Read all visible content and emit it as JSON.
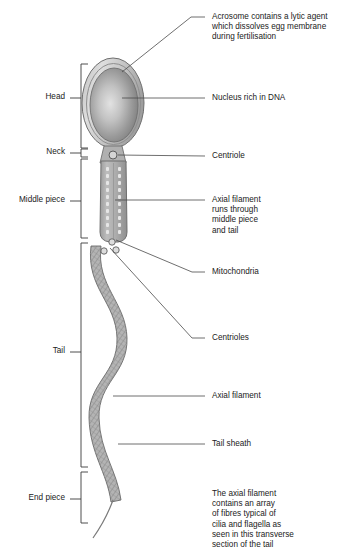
{
  "figure": {
    "background": "#ffffff",
    "ink": "#222222",
    "cell_fill": "#a8a8a8",
    "cell_outline": "#6d6d6d",
    "acrosome_fill": "#c9c9c9"
  },
  "region_labels": [
    {
      "id": "head",
      "text": "Head",
      "x": 66,
      "y": 98,
      "bracket_top": 64,
      "bracket_bottom": 148
    },
    {
      "id": "neck",
      "text": "Neck",
      "x": 66,
      "y": 152,
      "bracket_top": 149,
      "bracket_bottom": 157
    },
    {
      "id": "middle-piece",
      "text": "Middle piece",
      "x": 66,
      "y": 201,
      "bracket_top": 158,
      "bracket_bottom": 238
    },
    {
      "id": "tail",
      "text": "Tail",
      "x": 66,
      "y": 348,
      "bracket_top": 243,
      "bracket_bottom": 467
    },
    {
      "id": "end-piece",
      "text": "End piece",
      "x": 66,
      "y": 496,
      "bracket_top": 472,
      "bracket_bottom": 523
    }
  ],
  "callouts": [
    {
      "id": "acrosome",
      "text": "Acrosome contains a lytic agent\nwhich dissolves egg membrane\nduring fertilisation",
      "x": 212,
      "y": 12,
      "leader": "M 205 17 L 190 17 L 120 73"
    },
    {
      "id": "nucleus",
      "text": "Nucleus rich in DNA",
      "x": 212,
      "y": 94,
      "leader": "M 205 98 L 121 98"
    },
    {
      "id": "centriole",
      "text": "Centriole",
      "x": 212,
      "y": 152,
      "leader": "M 205 156 L 117 154"
    },
    {
      "id": "axial-filament-middle",
      "text": "Axial filament\nruns through\nmiddle piece\nand tail",
      "x": 212,
      "y": 196,
      "leader": "M 205 200 L 118 200"
    },
    {
      "id": "mitochondria",
      "text": "Mitochondria",
      "x": 212,
      "y": 268,
      "leader": "M 205 272 L 190 272 L 114 238"
    },
    {
      "id": "centrioles",
      "text": "Centrioles",
      "x": 212,
      "y": 334,
      "leader": "M 205 338 L 190 338 L 110 247"
    },
    {
      "id": "axial-filament-tail",
      "text": "Axial filament",
      "x": 212,
      "y": 392,
      "leader": "M 205 396 L 115 396"
    },
    {
      "id": "tail-sheath",
      "text": "Tail sheath",
      "x": 212,
      "y": 440,
      "leader": "M 205 444 L 117 444"
    },
    {
      "id": "transverse-section-note",
      "text": "The axial filament\ncontains an array\nof fibres typical of\ncilia and flagella as\nseen in this transverse\nsection of the tail",
      "x": 212,
      "y": 492,
      "leader": ""
    }
  ],
  "structures": {
    "head": {
      "cx": 113,
      "cy": 103,
      "rx": 31,
      "ry": 45
    },
    "neck": {
      "cx": 113,
      "cy": 155,
      "r": 4
    },
    "middle_piece": {
      "x_left": 100,
      "x_right": 127,
      "y_top": 160,
      "y_bottom": 240
    },
    "mitochondria_dots_per_column": 11,
    "centriole_circles": [
      {
        "cx": 112,
        "cy": 242,
        "r": 3
      },
      {
        "cx": 105,
        "cy": 250,
        "r": 3
      },
      {
        "cx": 117,
        "cy": 249,
        "r": 3
      }
    ],
    "tail_sheath_end_y": 500,
    "end_filament_tip": {
      "x": 93,
      "y": 538
    }
  }
}
